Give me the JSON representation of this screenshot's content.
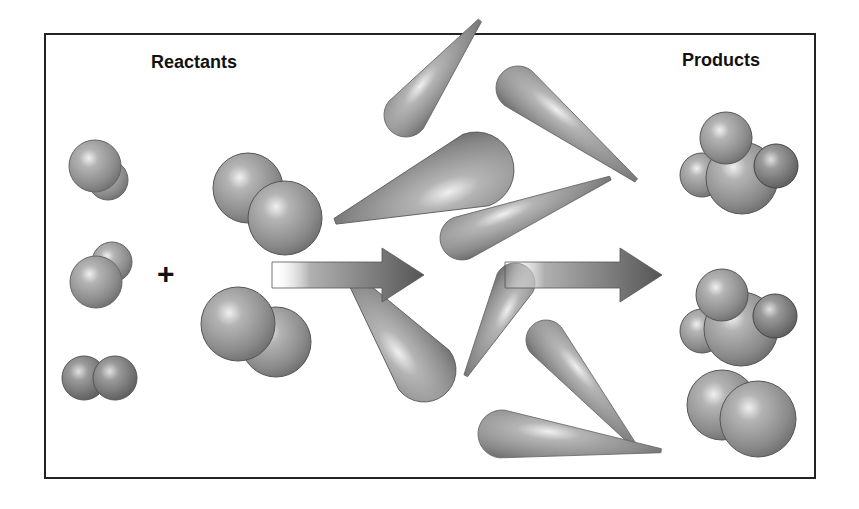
{
  "diagram": {
    "title_left": "Reactants",
    "title_right": "Products",
    "operator": "+",
    "reactants": [
      {
        "type": "diatomic-molecule",
        "atoms": 2
      },
      {
        "type": "diatomic-molecule",
        "atoms": 2
      },
      {
        "type": "diatomic-molecule",
        "atoms": 2
      },
      {
        "type": "diatomic-molecule",
        "atoms": 2
      },
      {
        "type": "diatomic-molecule",
        "atoms": 2
      }
    ],
    "middle": {
      "description": "molecules in motion colliding",
      "streaks": 8
    },
    "arrows": 2,
    "products": [
      {
        "type": "polyatomic-molecule",
        "atoms": 4
      },
      {
        "type": "polyatomic-molecule",
        "atoms": 4
      },
      {
        "type": "diatomic-molecule",
        "atoms": 2
      }
    ],
    "colors": {
      "sphere": "#8a8a8a",
      "frame": "#222222",
      "arrow": "#6a6a6a"
    }
  }
}
